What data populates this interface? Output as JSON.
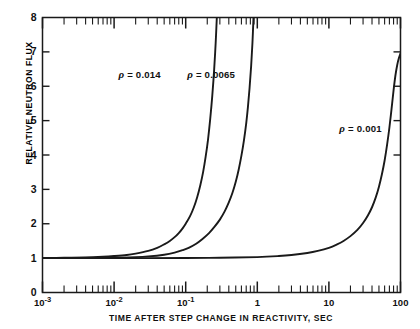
{
  "chart_data": {
    "type": "line",
    "title": "",
    "xlabel": "TIME AFTER STEP CHANGE IN REACTIVITY, SEC",
    "ylabel": "RELATIVE NEUTRON FLUX",
    "xscale": "log",
    "yscale": "linear",
    "xlim": [
      0.001,
      100
    ],
    "ylim": [
      0,
      8
    ],
    "grid": false,
    "legend_position": "inline-annotations",
    "xticks_major": [
      {
        "value": 0.001,
        "label": "10",
        "exponent": "-3"
      },
      {
        "value": 0.01,
        "label": "10",
        "exponent": "-2"
      },
      {
        "value": 0.1,
        "label": "10",
        "exponent": "-1"
      },
      {
        "value": 1,
        "label": "1",
        "exponent": ""
      },
      {
        "value": 10,
        "label": "10",
        "exponent": ""
      },
      {
        "value": 100,
        "label": "100",
        "exponent": ""
      }
    ],
    "yticks_major": [
      0,
      1,
      2,
      3,
      4,
      5,
      6,
      7,
      8
    ],
    "series": [
      {
        "name": "rho-0.014",
        "label_rho": "ρ",
        "label_text": " = 0.014",
        "label_x": 0.0115,
        "label_y": 6.35,
        "points": [
          [
            0.001,
            1.0
          ],
          [
            0.002,
            1.01
          ],
          [
            0.004,
            1.02
          ],
          [
            0.007,
            1.04
          ],
          [
            0.01,
            1.06
          ],
          [
            0.015,
            1.09
          ],
          [
            0.02,
            1.13
          ],
          [
            0.03,
            1.21
          ],
          [
            0.04,
            1.3
          ],
          [
            0.05,
            1.4
          ],
          [
            0.06,
            1.5
          ],
          [
            0.07,
            1.61
          ],
          [
            0.08,
            1.73
          ],
          [
            0.09,
            1.86
          ],
          [
            0.1,
            2.0
          ],
          [
            0.115,
            2.22
          ],
          [
            0.13,
            2.48
          ],
          [
            0.145,
            2.78
          ],
          [
            0.16,
            3.12
          ],
          [
            0.175,
            3.5
          ],
          [
            0.19,
            3.95
          ],
          [
            0.205,
            4.45
          ],
          [
            0.22,
            5.05
          ],
          [
            0.235,
            5.72
          ],
          [
            0.25,
            6.5
          ],
          [
            0.262,
            7.25
          ],
          [
            0.272,
            8.0
          ]
        ]
      },
      {
        "name": "rho-0.0065",
        "label_rho": "ρ",
        "label_text": " = 0.0065",
        "label_x": 0.105,
        "label_y": 6.35,
        "points": [
          [
            0.001,
            1.0
          ],
          [
            0.003,
            1.005
          ],
          [
            0.008,
            1.01
          ],
          [
            0.02,
            1.03
          ],
          [
            0.03,
            1.05
          ],
          [
            0.05,
            1.1
          ],
          [
            0.07,
            1.16
          ],
          [
            0.09,
            1.23
          ],
          [
            0.11,
            1.3
          ],
          [
            0.14,
            1.42
          ],
          [
            0.17,
            1.55
          ],
          [
            0.21,
            1.72
          ],
          [
            0.25,
            1.9
          ],
          [
            0.3,
            2.12
          ],
          [
            0.35,
            2.36
          ],
          [
            0.4,
            2.62
          ],
          [
            0.45,
            2.9
          ],
          [
            0.5,
            3.22
          ],
          [
            0.55,
            3.58
          ],
          [
            0.6,
            3.98
          ],
          [
            0.65,
            4.42
          ],
          [
            0.7,
            4.92
          ],
          [
            0.74,
            5.4
          ],
          [
            0.78,
            5.95
          ],
          [
            0.82,
            6.58
          ],
          [
            0.855,
            7.25
          ],
          [
            0.885,
            8.0
          ]
        ]
      },
      {
        "name": "rho-0.001",
        "label_rho": "ρ",
        "label_text": " = 0.001",
        "label_x": 14.0,
        "label_y": 4.78,
        "points": [
          [
            0.001,
            1.0
          ],
          [
            0.01,
            1.0
          ],
          [
            0.1,
            1.005
          ],
          [
            0.3,
            1.01
          ],
          [
            1,
            1.03
          ],
          [
            2,
            1.06
          ],
          [
            3,
            1.09
          ],
          [
            5,
            1.15
          ],
          [
            7,
            1.21
          ],
          [
            10,
            1.3
          ],
          [
            13,
            1.4
          ],
          [
            16,
            1.5
          ],
          [
            20,
            1.64
          ],
          [
            25,
            1.82
          ],
          [
            30,
            2.02
          ],
          [
            35,
            2.24
          ],
          [
            40,
            2.48
          ],
          [
            45,
            2.76
          ],
          [
            50,
            3.08
          ],
          [
            55,
            3.44
          ],
          [
            60,
            3.84
          ],
          [
            65,
            4.3
          ],
          [
            70,
            4.8
          ],
          [
            75,
            5.34
          ],
          [
            80,
            5.88
          ],
          [
            85,
            6.32
          ],
          [
            90,
            6.62
          ],
          [
            95,
            6.82
          ],
          [
            100,
            6.95
          ]
        ]
      }
    ]
  }
}
